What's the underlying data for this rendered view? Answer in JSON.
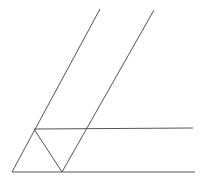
{
  "figure": {
    "width": 202,
    "height": 181,
    "background_color": "#ffffff",
    "stroke_color": "#555555",
    "stroke_width": 1,
    "segments": [
      {
        "name": "left-transversal-line",
        "label": "Left slanted transversal",
        "x1": 12,
        "y1": 172,
        "x2": 100,
        "y2": 9
      },
      {
        "name": "right-transversal-line",
        "label": "Right slanted transversal",
        "x1": 62,
        "y1": 172,
        "x2": 154,
        "y2": 10
      },
      {
        "name": "upper-horizontal-line",
        "label": "Upper horizontal line",
        "x1": 34,
        "y1": 129,
        "x2": 193,
        "y2": 128
      },
      {
        "name": "lower-horizontal-line",
        "label": "Lower horizontal line",
        "x1": 12,
        "y1": 172,
        "x2": 195,
        "y2": 172
      },
      {
        "name": "v-left-arm-line",
        "label": "Left arm of the V",
        "x1": 34,
        "y1": 129,
        "x2": 62,
        "y2": 172
      }
    ],
    "vertices": [
      {
        "name": "bottom-left-vertex",
        "label": "Bottom left corner",
        "x": 12,
        "y": 172
      },
      {
        "name": "left-horizontal-vertex",
        "label": "Left end of upper horizontal",
        "x": 34,
        "y": 129
      },
      {
        "name": "v-bottom-vertex",
        "label": "Bottom vertex of the V",
        "x": 62,
        "y": 172
      },
      {
        "name": "right-slant-crossing-vertex",
        "label": "Right slant crosses upper horizontal",
        "x": 89,
        "y": 128
      },
      {
        "name": "left-slant-apex",
        "label": "Top of left slanted line",
        "x": 100,
        "y": 9
      },
      {
        "name": "right-slant-apex",
        "label": "Top of right slanted line",
        "x": 154,
        "y": 10
      },
      {
        "name": "upper-horizontal-right-end",
        "label": "Right end of upper horizontal",
        "x": 193,
        "y": 128
      },
      {
        "name": "lower-horizontal-right-end",
        "label": "Right end of lower horizontal",
        "x": 195,
        "y": 172
      }
    ]
  }
}
